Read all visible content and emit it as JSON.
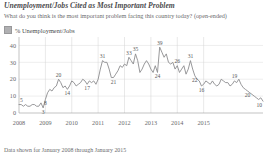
{
  "header": {
    "title": "Unemployment/Jobs Cited as Most Important Problem",
    "subtitle": "What do you think is the most important problem facing this country today? (open-ended)"
  },
  "legend": {
    "position": "top-left",
    "swatch_color": "#b0b0b2",
    "items": [
      {
        "label": "% Unemployment/Jobs",
        "color": "#b0b0b2"
      }
    ]
  },
  "footnote": "Data shown for January 2008 through January 2015",
  "chart_data": {
    "type": "line",
    "title": "Unemployment/Jobs Cited as Most Important Problem",
    "subtitle": "What do you think is the most important problem facing this country today? (open-ended)",
    "xlabel": "",
    "ylabel": "",
    "ylim": [
      0,
      45
    ],
    "yticks": [
      0,
      10,
      20,
      30,
      40
    ],
    "ytick_labels": [
      "0",
      "10",
      "20",
      "30",
      "40"
    ],
    "xticks": [
      2008,
      2009,
      2010,
      2011,
      2012,
      2013,
      2014,
      2015
    ],
    "xtick_labels": [
      "2008",
      "2009",
      "2010",
      "2011",
      "2012",
      "2013",
      "2014",
      "2015"
    ],
    "grid": true,
    "line_color": "#8c8c8e",
    "series": [
      {
        "name": "% Unemployment/Jobs",
        "values": [
          5,
          5,
          4,
          5,
          4,
          4,
          5,
          5,
          4,
          4,
          6,
          3,
          8,
          12,
          14,
          13,
          15,
          16,
          20,
          18,
          15,
          16,
          14,
          16,
          19,
          18,
          16,
          17,
          18,
          20,
          19,
          17,
          19,
          18,
          19,
          17,
          20,
          26,
          31,
          30,
          30,
          26,
          21,
          21,
          23,
          25,
          28,
          27,
          29,
          28,
          33,
          31,
          29,
          35,
          31,
          24,
          26,
          29,
          31,
          29,
          26,
          24,
          28,
          24,
          39,
          36,
          33,
          35,
          30,
          29,
          30,
          26,
          28,
          24,
          26,
          28,
          23,
          26,
          31,
          26,
          22,
          20,
          19,
          16,
          17,
          19,
          18,
          17,
          19,
          17,
          16,
          17,
          20,
          19,
          18,
          18,
          16,
          17,
          19,
          18,
          20,
          17,
          15,
          14,
          13,
          12,
          11,
          10,
          9,
          8,
          9,
          7
        ]
      }
    ],
    "labeled_points": [
      {
        "label": "5",
        "index": 0
      },
      {
        "label": "3",
        "index": 11
      },
      {
        "label": "8",
        "index": 12
      },
      {
        "label": "20",
        "index": 18
      },
      {
        "label": "14",
        "index": 22
      },
      {
        "label": "17",
        "index": 31
      },
      {
        "label": "31",
        "index": 38
      },
      {
        "label": "21",
        "index": 43
      },
      {
        "label": "33",
        "index": 50
      },
      {
        "label": "35",
        "index": 53
      },
      {
        "label": "39",
        "index": 64
      },
      {
        "label": "24",
        "index": 63
      },
      {
        "label": "26",
        "index": 72
      },
      {
        "label": "22",
        "index": 80
      },
      {
        "label": "31",
        "index": 78
      },
      {
        "label": "16",
        "index": 83
      },
      {
        "label": "19",
        "index": 98
      },
      {
        "label": "20",
        "index": 104
      },
      {
        "label": "10",
        "index": 111
      },
      {
        "label": "7",
        "index": 113
      }
    ]
  }
}
